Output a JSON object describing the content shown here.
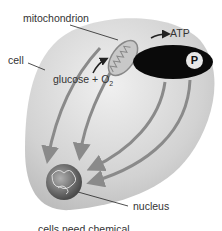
{
  "diagram": {
    "labels": {
      "mitochondrion": "mitochondrion",
      "atp": "ATP",
      "cell": "cell",
      "glucose": "glucose + O",
      "o2_subscript": "2",
      "nucleus": "nucleus",
      "caption": "cells need chemical",
      "p_badge": "P"
    },
    "colors": {
      "cell_fill": "#d6d6d6",
      "arrow": "#8a8a8a",
      "dark_ellipse": "#0a0a0a",
      "text": "#333333"
    }
  }
}
